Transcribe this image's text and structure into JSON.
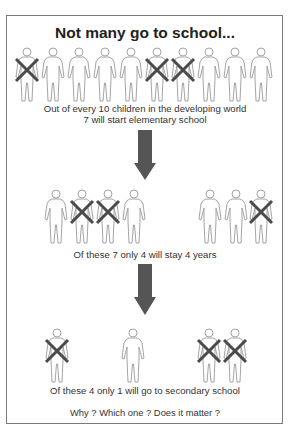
{
  "title": "Not many go to school...",
  "stages": [
    {
      "caption_line1": "Out of every 10 children in the developing world",
      "caption_line2": "7 will start elementary school",
      "figures": [
        {
          "x": 14,
          "crossed": true
        },
        {
          "x": 40,
          "crossed": false
        },
        {
          "x": 66,
          "crossed": false
        },
        {
          "x": 92,
          "crossed": false
        },
        {
          "x": 118,
          "crossed": false
        },
        {
          "x": 144,
          "crossed": true
        },
        {
          "x": 170,
          "crossed": true
        },
        {
          "x": 196,
          "crossed": false
        },
        {
          "x": 222,
          "crossed": false
        },
        {
          "x": 248,
          "crossed": false
        }
      ],
      "figures_top": 47
    },
    {
      "caption": "Of these 7 only 4 will stay 4 years",
      "figures": [
        {
          "x": 43,
          "crossed": false
        },
        {
          "x": 69,
          "crossed": true
        },
        {
          "x": 95,
          "crossed": true
        },
        {
          "x": 121,
          "crossed": false
        },
        {
          "x": 197,
          "crossed": false
        },
        {
          "x": 223,
          "crossed": false
        },
        {
          "x": 248,
          "crossed": true
        }
      ],
      "figures_top": 189
    },
    {
      "caption": "Of these 4 only 1 will go to secondary school",
      "figures": [
        {
          "x": 44,
          "crossed": true
        },
        {
          "x": 120,
          "crossed": false
        },
        {
          "x": 196,
          "crossed": true
        },
        {
          "x": 222,
          "crossed": true
        }
      ],
      "figures_top": 328
    }
  ],
  "closing_question": "Why ? Which one ? Does it matter ?",
  "colors": {
    "figure_outline": "#9a9a9a",
    "cross": "#4a4a4a",
    "arrow": "#555555",
    "border": "#7a7a7a"
  }
}
